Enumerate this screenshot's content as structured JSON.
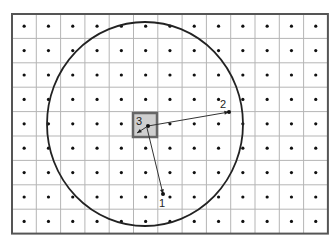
{
  "diagram": {
    "grid": {
      "x0": 12,
      "y0": 14,
      "cols": 13,
      "rows": 9,
      "cell_w": 24.3,
      "cell_h": 24.4,
      "line_color": "#b5b5b5",
      "border_color": "#555555",
      "dot_color": "#111111"
    },
    "circle": {
      "cx": 145,
      "cy": 124,
      "rx": 98,
      "ry": 102,
      "color": "#222222"
    },
    "center_square": {
      "x": 133,
      "y": 113,
      "w": 24,
      "h": 24,
      "fill": "#cfcfcf",
      "stroke": "#666666",
      "label": "3"
    },
    "points": [
      {
        "id": "1",
        "label": "1",
        "x": 163,
        "y": 194,
        "label_x": 159,
        "label_y": 207
      },
      {
        "id": "2",
        "label": "2",
        "x": 229,
        "y": 112,
        "label_x": 220,
        "label_y": 108
      },
      {
        "id": "3",
        "label": "3",
        "x": 148,
        "y": 126,
        "label_x": 136,
        "label_y": 125
      }
    ],
    "vectors": [
      {
        "from": [
          148,
          126
        ],
        "to": [
          229,
          112
        ]
      },
      {
        "from": [
          147,
          128
        ],
        "to": [
          163,
          194
        ]
      },
      {
        "from": [
          148,
          126
        ],
        "to": [
          137,
          133
        ]
      }
    ]
  }
}
